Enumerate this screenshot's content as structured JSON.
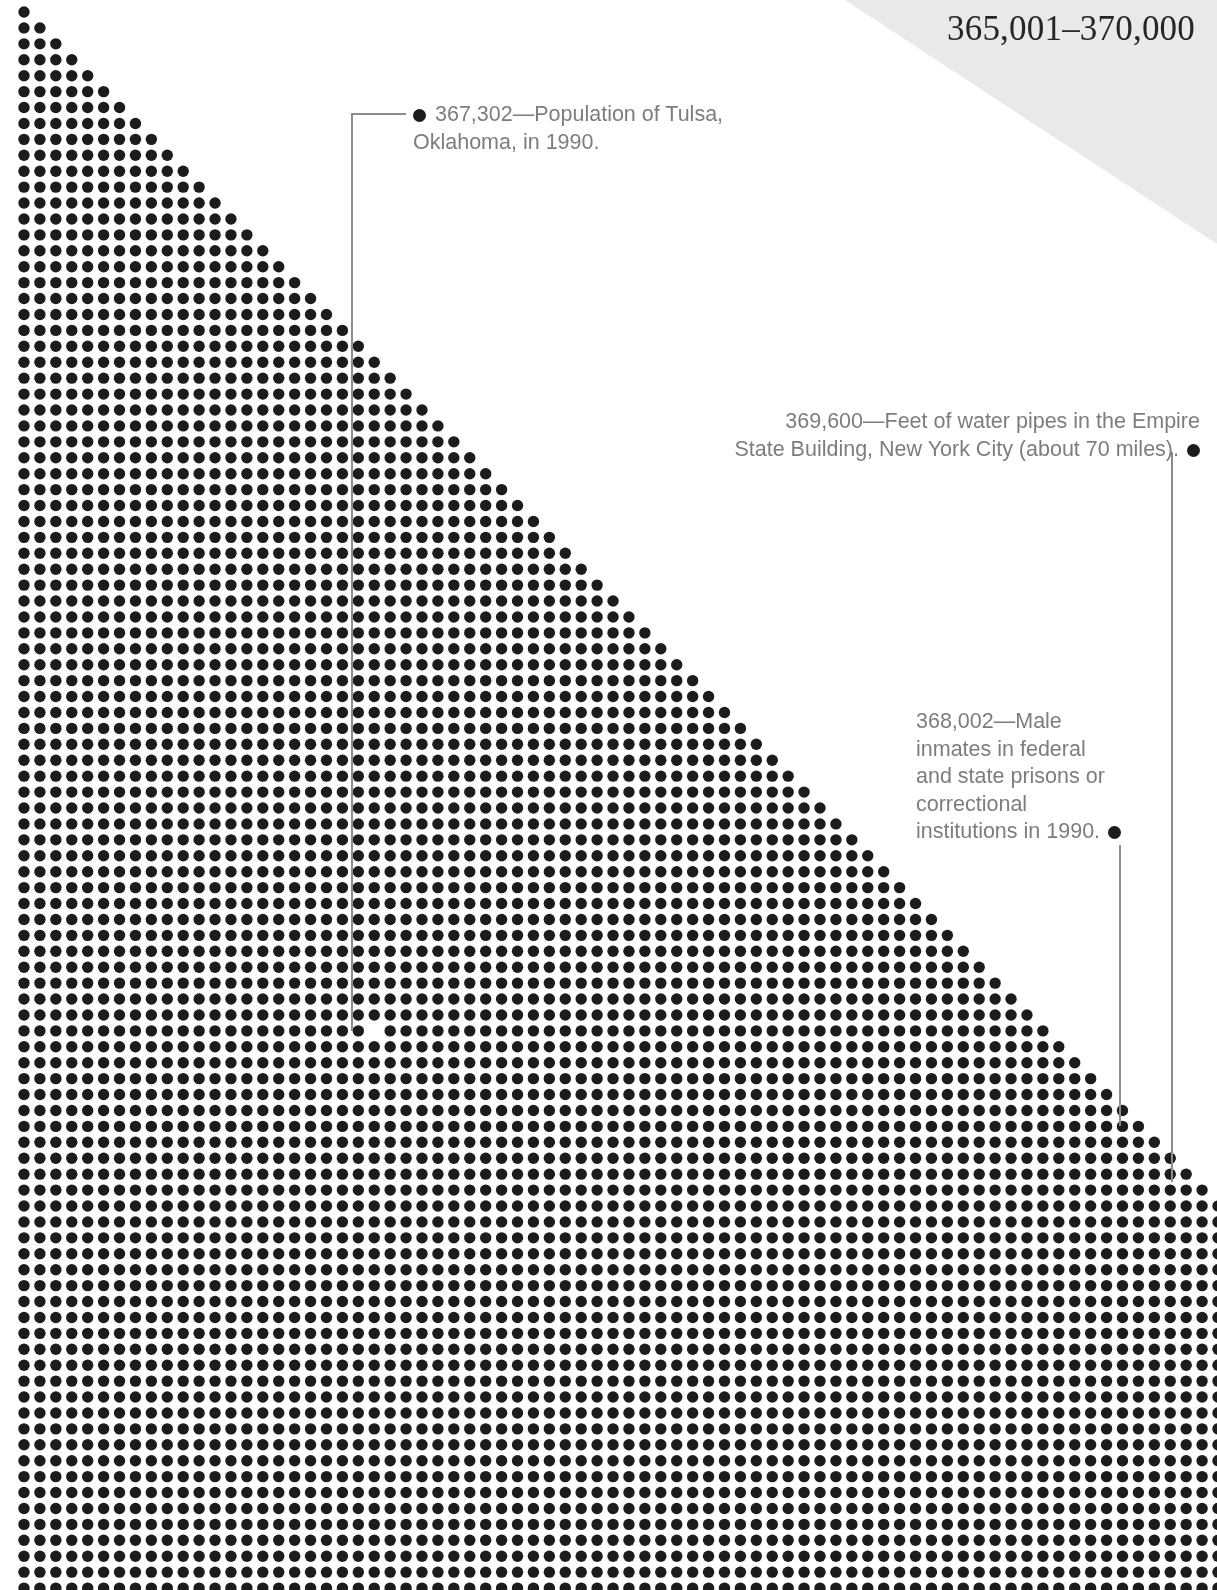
{
  "header": {
    "range_label": "365,001–370,000",
    "band_color": "#e8e9e9"
  },
  "chart_data": {
    "type": "scatter",
    "title": "365,001–370,000",
    "dot_color": "#1c1c1c",
    "dot_diameter_px": 11.4,
    "grid_pitch_px": 15.92,
    "grid_origin_x_px": 24,
    "grid_origin_y_px": 12,
    "columns": 75,
    "rows": 100,
    "range_start": 365001,
    "range_end": 370000,
    "highlight_marker": {
      "type": "void-dot",
      "col": 22,
      "row": 64,
      "note": "One dot is rendered white to mark the value 367,302."
    },
    "annotations": [
      {
        "id": "tulsa",
        "value": 367302,
        "value_label": "367,302",
        "text": "367,302—Population of Tulsa,\nOklahoma, in 1990.",
        "bullet_side": "leading",
        "align": "left",
        "leader": {
          "kind": "elbow",
          "start_x": 406,
          "start_y": 114,
          "corner_x": 352,
          "corner_y": 114,
          "end_x": 352,
          "end_y": 1031
        }
      },
      {
        "id": "empire-state-pipes",
        "value": 369600,
        "value_label": "369,600",
        "text": "369,600—Feet of water pipes in the Empire\nState Building, New York City (about 70 miles).",
        "bullet_side": "trailing",
        "align": "right",
        "leader": {
          "kind": "vertical",
          "start_x": 1172,
          "start_y": 452,
          "end_x": 1172,
          "end_y": 1182
        }
      },
      {
        "id": "male-inmates",
        "value": 368002,
        "value_label": "368,002",
        "text": "368,002—Male\ninmates in federal\nand state prisons or\ncorrectional\ninstitutions in 1990.",
        "bullet_side": "trailing",
        "align": "left",
        "leader": {
          "kind": "vertical",
          "start_x": 1120,
          "start_y": 845,
          "end_x": 1120,
          "end_y": 1126
        }
      }
    ],
    "text_color": "#7d7d7d",
    "leader_color": "#8c8c8c"
  }
}
